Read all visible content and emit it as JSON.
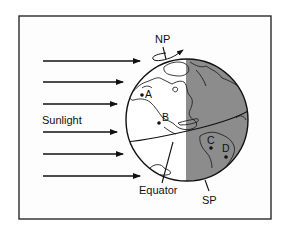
{
  "figure": {
    "labels": {
      "sunlight": "Sunlight",
      "north_pole": "NP",
      "south_pole": "SP",
      "equator": "Equator"
    },
    "points": [
      {
        "id": "A",
        "label": "A"
      },
      {
        "id": "B",
        "label": "B"
      },
      {
        "id": "C",
        "label": "C"
      },
      {
        "id": "D",
        "label": "D"
      }
    ],
    "sunlight_arrows": 6,
    "colors": {
      "lit_side": "#ffffff",
      "dark_side": "#8c8c8c",
      "ink": "#111111",
      "frame": "#2a2a2a"
    }
  }
}
